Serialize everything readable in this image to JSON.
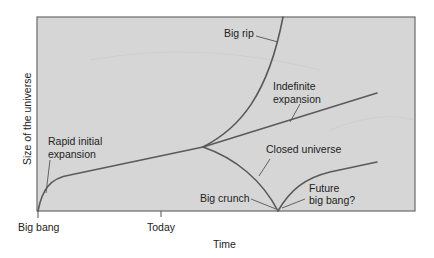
{
  "diagram": {
    "type": "universe-fate-diagram",
    "colors": {
      "plot_background": "#d6d6d6",
      "plot_border": "#6a6a6a",
      "curve": "#5a5a5a",
      "text": "#222222"
    },
    "axes": {
      "x_label": "Time",
      "y_label": "Size of the universe",
      "x_ticks": [
        {
          "label": "Big bang",
          "position": "origin"
        },
        {
          "label": "Today",
          "position": "today"
        }
      ]
    },
    "annotations": {
      "rapid_initial_expansion": [
        "Rapid initial",
        "expansion"
      ],
      "big_rip": "Big rip",
      "indefinite_expansion": [
        "Indefinite",
        "expansion"
      ],
      "closed_universe": "Closed universe",
      "big_crunch": "Big crunch",
      "future_big_bang": [
        "Future",
        "big bang?"
      ]
    },
    "curves": [
      {
        "name": "early-expansion",
        "description": "Rapid initial expansion from big bang to today"
      },
      {
        "name": "big-rip",
        "description": "Accelerating expansion going off the top"
      },
      {
        "name": "indefinite-expansion",
        "description": "Linear continued expansion"
      },
      {
        "name": "closed-universe",
        "description": "Re-collapse to big crunch"
      },
      {
        "name": "future-big-bang",
        "description": "New expansion after big crunch"
      }
    ]
  }
}
